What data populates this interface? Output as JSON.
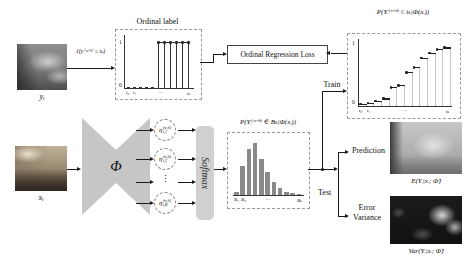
{
  "colors": {
    "arrow": "#1a1a1a",
    "bar_fill": "#8a8a8a",
    "shape_fill": "#c6c6c6",
    "softmax_fill": "#d0d0d0",
    "grid_line": "#c6c6c6",
    "dashed_border": "#9a9a9a",
    "axis": "#333333"
  },
  "labels": {
    "target_image": "yᵢ",
    "input_image": "xᵢ",
    "indicator_formula": "1(yᵢ⁽ʷʼʰ⁾ ≤ tₖ)",
    "ordinal_label_title": "Ordinal label",
    "ordinal_regression_loss": "Ordinal Regression Loss",
    "cdf_formula": "P(Yᵢ⁽ʷʼʰ⁾ ≤ tₖ|Φ(xᵢ))",
    "pmf_formula": "P(Yᵢ⁽ʷʼʰ⁾ ∈ Bₖ|Φ(xᵢ))",
    "encoder_symbol": "Φ",
    "softmax": "Softmax",
    "train": "Train",
    "test": "Test",
    "prediction": "Prediction",
    "error_line1": "Error",
    "error_line2": "Variance",
    "expectation_caption": "E(Yᵢ|xᵢ; Φ̂)",
    "variance_caption": "Var(Yᵢ|xᵢ; Φ̂)"
  },
  "logits": {
    "sup": "(w,h)",
    "vdots": "⋮",
    "items": [
      {
        "base": "η",
        "sub": "i,1"
      },
      {
        "base": "η",
        "sub": "i,2"
      },
      {
        "base": "η",
        "sub": "i,K"
      }
    ]
  },
  "chart_data": [
    {
      "name": "ordinal_label",
      "type": "stem",
      "title": "Ordinal label",
      "x_ticks": [
        "t₀",
        "t₁",
        "⋯",
        "tₖ"
      ],
      "y_ticks": [
        "0",
        "1"
      ],
      "values": [
        0,
        0,
        0,
        0,
        0,
        1,
        1,
        1,
        1,
        1,
        1
      ],
      "ylim": [
        0,
        1
      ]
    },
    {
      "name": "cumulative_probability",
      "type": "step",
      "title": "P(Yᵢ⁽ʷʼʰ⁾ ≤ tₖ|Φ(xᵢ))",
      "x_ticks": [
        "t₀",
        "t₁",
        "⋯",
        "tₖ"
      ],
      "y_ticks": [
        "0",
        "1"
      ],
      "values": [
        0.02,
        0.04,
        0.07,
        0.11,
        0.3,
        0.33,
        0.55,
        0.63,
        0.79,
        0.87,
        0.93,
        0.96
      ],
      "ylim": [
        0,
        1
      ]
    },
    {
      "name": "bin_probability",
      "type": "bar",
      "title": "P(Yᵢ⁽ʷʼʰ⁾ ∈ Bₖ|Φ(xᵢ))",
      "x_ticks": [
        "B₁",
        "B₂",
        "⋯",
        "Bₖ"
      ],
      "values": [
        0.05,
        0.55,
        0.88,
        1.0,
        0.7,
        0.45,
        0.25,
        0.13,
        0.06,
        0.03,
        0.015
      ],
      "ylim": [
        0,
        1
      ]
    }
  ]
}
